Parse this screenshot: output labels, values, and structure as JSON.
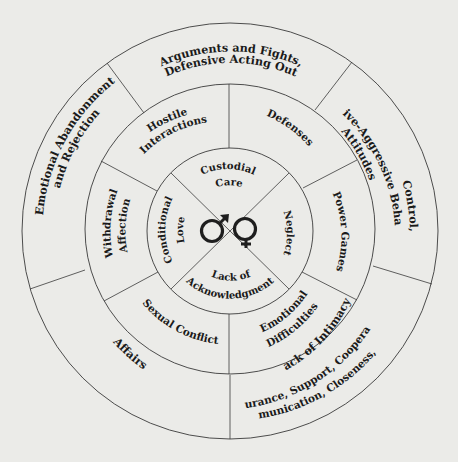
{
  "colors": {
    "background": "#ebebe8",
    "outer_ring": "#f3f3f0",
    "middle_ring": "#8c8c8a",
    "inner_circle": "#f3f3f0",
    "lines": "#3a3a3a",
    "text": "#1a1a1a"
  },
  "outer_ring": {
    "top": {
      "line1": "Arguments and Fights,",
      "line2": "Defensive Acting Out"
    },
    "top_right": {
      "line1": "Control,",
      "line2": "Passive-Aggressive Behavior,",
      "line3": "Attitudes"
    },
    "bottom_right": {
      "line1": "Lack of Intimacy,",
      "line2": "Nurturance, Support, Cooperation,",
      "line3": "Communication, Closeness, Unity"
    },
    "bottom_left": {
      "line1": "Affairs"
    },
    "left": {
      "line1": "Emotional Abandonment",
      "line2": "and Rejection"
    }
  },
  "middle_ring": {
    "top_left": {
      "line1": "Hostile",
      "line2": "Interactions"
    },
    "top_right": {
      "line1": "Defenses"
    },
    "right": {
      "line1": "Power Games"
    },
    "bottom_right": {
      "line1": "Emotional",
      "line2": "Difficulties"
    },
    "bottom_left": {
      "line1": "Sexual Conflict"
    },
    "left": {
      "line1": "Withdrawal",
      "line2": "Affection"
    }
  },
  "inner_circle": {
    "top": {
      "line1": "Custodial",
      "line2": "Care"
    },
    "right": {
      "line1": "Neglect"
    },
    "bottom": {
      "line1": "Lack of",
      "line2": "Acknowledgment"
    },
    "left": {
      "line1": "Conditional",
      "line2": "Love"
    }
  },
  "center_icons": [
    "male-symbol-icon",
    "female-symbol-icon"
  ]
}
